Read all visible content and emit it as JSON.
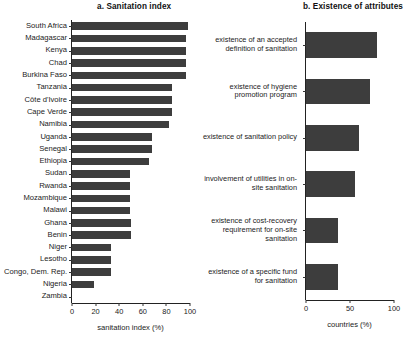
{
  "chart_data": [
    {
      "type": "bar",
      "id": "panel-a",
      "title": "a. Sanitation index",
      "orientation": "horizontal",
      "xlabel": "sanitation index (%)",
      "ylabel": "",
      "xlim": [
        0,
        100
      ],
      "xticks": [
        0,
        20,
        40,
        60,
        80,
        100
      ],
      "xtick_labels": [
        "0",
        "20",
        "40",
        "60",
        "80",
        "100"
      ],
      "grid": false,
      "legend": false,
      "bar_color": "#3d3d3d",
      "categories": [
        "South Africa",
        "Madagascar",
        "Kenya",
        "Chad",
        "Burkina Faso",
        "Tanzania",
        "Côte d'Ivoire",
        "Cape Verde",
        "Namibia",
        "Uganda",
        "Senegal",
        "Ethiopia",
        "Sudan",
        "Rwanda",
        "Mozambique",
        "Malawi",
        "Ghana",
        "Benin",
        "Niger",
        "Lesotho",
        "Congo, Dem. Rep.",
        "Nigeria",
        "Zambia"
      ],
      "values": [
        98,
        97,
        97,
        97,
        97,
        85,
        85,
        85,
        82,
        68,
        68,
        65,
        49,
        49,
        49,
        49,
        50,
        50,
        33,
        33,
        33,
        19,
        0
      ]
    },
    {
      "type": "bar",
      "id": "panel-b",
      "title": "b. Existence of attributes",
      "orientation": "horizontal",
      "xlabel": "countries (%)",
      "ylabel": "",
      "xlim": [
        0,
        100
      ],
      "xticks": [
        0,
        50,
        100
      ],
      "xtick_labels": [
        "0",
        "50",
        "100"
      ],
      "grid": false,
      "legend": false,
      "bar_color": "#3d3d3d",
      "categories": [
        "existence of an accepted definition of sanitation",
        "existence of hygiene promotion program",
        "existence of sanitation policy",
        "involvement of utilities in on-site sanitation",
        "existence of cost-recovery requirement for on-site sanitation",
        "existence of a specific fund for sanitation"
      ],
      "values": [
        81,
        73,
        60,
        56,
        36,
        36
      ]
    }
  ]
}
